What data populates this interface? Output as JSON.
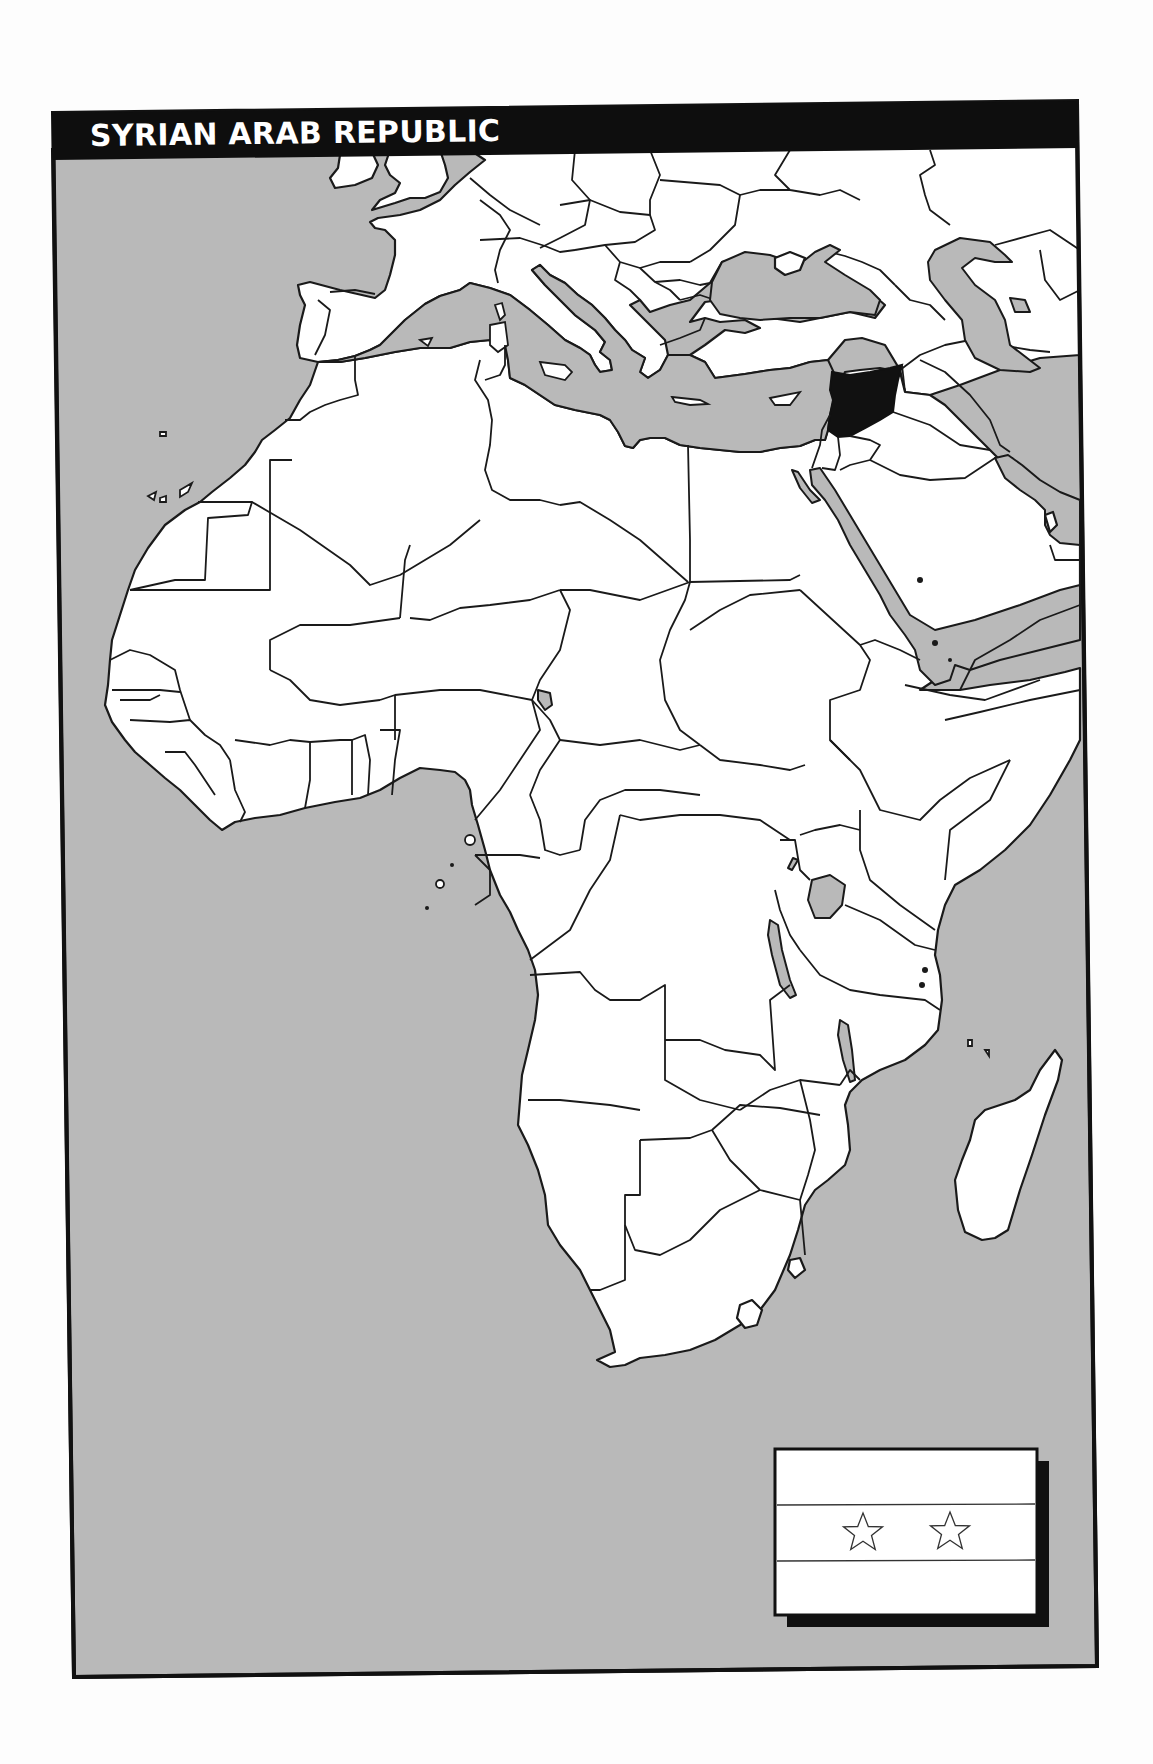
{
  "title": "SYRIAN ARAB REPUBLIC",
  "map": {
    "region_shown": "Africa, Europe and the Middle East",
    "highlighted_country": "Syria",
    "colors": {
      "sea": "#b9b9b9",
      "land": "#ffffff",
      "border": "#1a1a1a",
      "highlight": "#111111",
      "title_bar": "#0e0e0e",
      "title_text": "#ffffff",
      "page": "#fdfdfd"
    }
  },
  "flag": {
    "country": "Syria",
    "stripes": 3,
    "stars": 2,
    "star_icon": "star-outline-icon"
  }
}
